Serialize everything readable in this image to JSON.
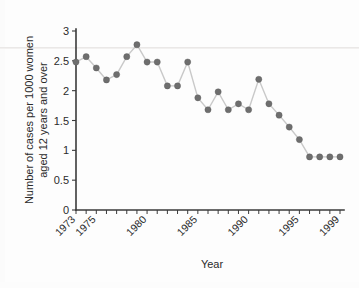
{
  "chart_data": {
    "type": "line",
    "title": "",
    "xlabel": "Year",
    "ylabel": "Number of cases per 1000 women aged 12 years and over",
    "ylabel_line1": "Number of cases per 1000 women",
    "ylabel_line2": "aged 12 years and over",
    "xlim": [
      1972.5,
      1999.5
    ],
    "ylim": [
      0,
      3
    ],
    "yticks": [
      0,
      0.5,
      1,
      1.5,
      2,
      2.5,
      3
    ],
    "ytick_labels": [
      "0",
      "0.5",
      "1",
      "1.5",
      "2",
      "2.5",
      "3"
    ],
    "xticks": [
      1973,
      1974,
      1975,
      1976,
      1977,
      1978,
      1979,
      1980,
      1981,
      1982,
      1983,
      1984,
      1985,
      1986,
      1987,
      1988,
      1989,
      1990,
      1991,
      1992,
      1993,
      1994,
      1995,
      1996,
      1997,
      1998,
      1999
    ],
    "xtick_labels_shown": [
      "1973",
      "1975",
      "1980",
      "1985",
      "1990",
      "1995",
      "1999"
    ],
    "xtick_labels_shown_years": [
      1973,
      1975,
      1980,
      1985,
      1990,
      1995,
      1999
    ],
    "xtick_label_rotation": -45,
    "grid": false,
    "legend": "none",
    "marker": "circle",
    "marker_color": "#6e6e6e",
    "line_color": "#c9c9c9",
    "axis_color": "#3a3a3a",
    "background_color": "#fdfdfd",
    "x": [
      1973,
      1974,
      1975,
      1976,
      1977,
      1978,
      1979,
      1980,
      1981,
      1982,
      1983,
      1984,
      1985,
      1986,
      1987,
      1988,
      1989,
      1990,
      1991,
      1992,
      1993,
      1994,
      1995,
      1996,
      1997,
      1998,
      1999
    ],
    "values": [
      2.48,
      2.57,
      2.38,
      2.18,
      2.27,
      2.57,
      2.77,
      2.48,
      2.48,
      2.08,
      2.08,
      2.48,
      1.88,
      1.68,
      1.98,
      1.68,
      1.78,
      1.68,
      2.19,
      1.78,
      1.59,
      1.39,
      1.18,
      0.89,
      0.89,
      0.89,
      0.89
    ],
    "n_points": 27,
    "series": [
      {
        "name": "cases per 1000 women aged 12 years and over",
        "values": [
          2.48,
          2.57,
          2.38,
          2.18,
          2.27,
          2.57,
          2.77,
          2.48,
          2.48,
          2.08,
          2.08,
          2.48,
          1.88,
          1.68,
          1.98,
          1.68,
          1.78,
          1.68,
          2.19,
          1.78,
          1.59,
          1.39,
          1.18,
          0.89,
          0.89,
          0.89,
          0.89
        ]
      }
    ]
  }
}
